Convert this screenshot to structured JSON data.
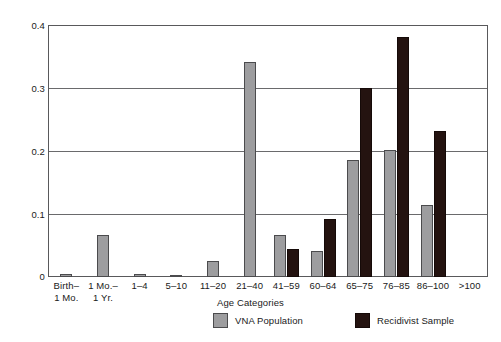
{
  "chart_data": {
    "type": "bar",
    "title": "",
    "xlabel": "Age Categories",
    "ylabel": "",
    "ylim": [
      0,
      0.4
    ],
    "yticks": [
      "0",
      "0.1",
      "0.2",
      "0.3",
      "0.4"
    ],
    "ytick_values": [
      0,
      0.1,
      0.2,
      0.3,
      0.4
    ],
    "grid": true,
    "legend_position": "bottom",
    "categories": [
      "Birth–\n1 Mo.",
      "1 Mo.–\n1 Yr.",
      "1–4",
      "5–10",
      "11–20",
      "21–40",
      "41–59",
      "60–64",
      "65–75",
      "76–85",
      "86–100",
      ">100"
    ],
    "series": [
      {
        "name": "VNA Population",
        "color": "#9d9d9f",
        "values": [
          0.004,
          0.067,
          0.005,
          0.003,
          0.025,
          0.342,
          0.067,
          0.041,
          0.186,
          0.201,
          0.115,
          0.0
        ]
      },
      {
        "name": "Recidivist Sample",
        "color": "#241310",
        "values": [
          0.0,
          0.0,
          0.0,
          0.0,
          0.0,
          0.0,
          0.044,
          0.092,
          0.3,
          0.381,
          0.231,
          0.0
        ]
      }
    ]
  },
  "axis_title": "Age Categories",
  "legend": {
    "items": [
      {
        "label": "VNA Population",
        "swatch": "gray-swatch"
      },
      {
        "label": "Recidivist Sample",
        "swatch": "dark-swatch"
      }
    ]
  }
}
